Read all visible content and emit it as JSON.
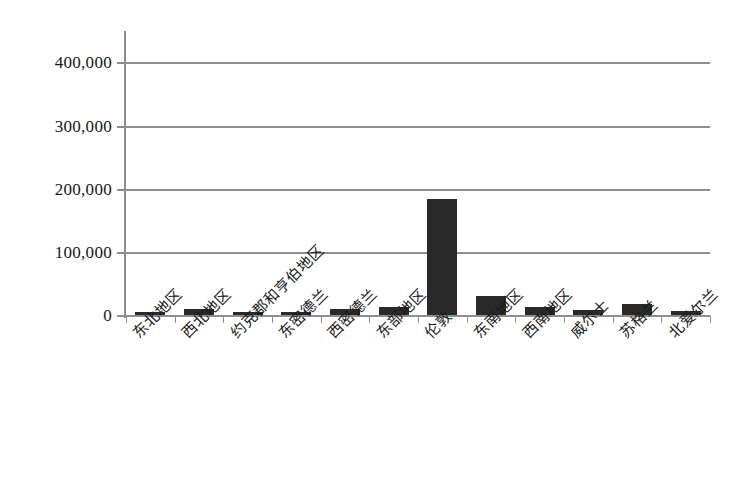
{
  "chart_data": {
    "type": "bar",
    "title": "",
    "subtitle": "",
    "xlabel": "",
    "ylabel": "",
    "grid": true,
    "legend": false,
    "legend_position": "none",
    "ylim": [
      0,
      430000
    ],
    "y_ticks": [
      0,
      100000,
      200000,
      300000,
      400000
    ],
    "y_tick_labels": [
      "0",
      "100,000",
      "200,000",
      "300,000",
      "400,000"
    ],
    "categories": [
      "东北地区",
      "西北地区",
      "约克郡和亨伯地区",
      "东密德兰",
      "西密德兰",
      "东部地区",
      "伦敦",
      "东南地区",
      "西南地区",
      "威尔士",
      "苏格兰",
      "北爱尔兰"
    ],
    "values": [
      5000,
      9000,
      5000,
      5500,
      9000,
      12000,
      183000,
      30000,
      13000,
      8000,
      17000,
      6000
    ],
    "bar_color": "#2b2a2a",
    "axis_color": "#8e8e8e",
    "grid_color": "#8e8e8e",
    "background_color": "#ffffff"
  }
}
